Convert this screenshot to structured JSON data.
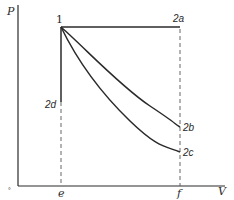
{
  "diagram": {
    "type": "pv-diagram",
    "axes": {
      "y_label": "P",
      "x_label": "V"
    },
    "points": {
      "p1": "1",
      "p2a": "2a",
      "p2b": "2b",
      "p2c": "2c",
      "p2d": "2d"
    },
    "x_ticks": {
      "e": "e",
      "f": "f"
    },
    "origin_mark": "°",
    "processes": [
      {
        "from": "1",
        "to": "2a",
        "kind": "isobaric"
      },
      {
        "from": "1",
        "to": "2b",
        "kind": "curve (upper)"
      },
      {
        "from": "1",
        "to": "2c",
        "kind": "curve (lower)"
      },
      {
        "from": "1",
        "to": "2d",
        "kind": "isochoric"
      }
    ],
    "colors": {
      "line": "#2a2a2a",
      "dashed": "#555555",
      "background": "#ffffff"
    }
  }
}
